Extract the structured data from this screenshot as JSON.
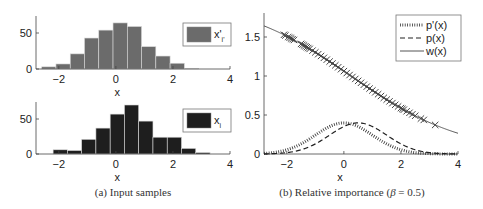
{
  "chart_data": [
    {
      "id": "hist-top",
      "type": "bar",
      "subtype": "histogram",
      "title": "",
      "xlabel": "x",
      "ylabel": "",
      "xlim": [
        -2.8,
        4
      ],
      "ylim": [
        0,
        68
      ],
      "xticks": [
        -2,
        0,
        2,
        4
      ],
      "yticks": [
        0,
        50
      ],
      "bin_width": 0.5,
      "bin_edges_start": -2.6,
      "values": [
        3,
        7,
        21,
        43,
        54,
        64,
        59,
        31,
        18,
        8,
        1
      ],
      "legend": {
        "label": "x'",
        "subscript": "i'",
        "placement": "top-right"
      },
      "color": "#6b6b6b"
    },
    {
      "id": "hist-bottom",
      "type": "bar",
      "subtype": "histogram",
      "title": "",
      "xlabel": "x",
      "ylabel": "",
      "xlim": [
        -2.8,
        4
      ],
      "ylim": [
        0,
        68
      ],
      "xticks": [
        -2,
        0,
        2,
        4
      ],
      "yticks": [
        0,
        50
      ],
      "bin_width": 0.5,
      "bin_edges_start": -2.2,
      "values": [
        6,
        5,
        21,
        37,
        57,
        70,
        47,
        24,
        24,
        8,
        2
      ],
      "legend": {
        "label": "x",
        "subscript": "i",
        "placement": "top-right"
      },
      "color": "#1e1e1e"
    },
    {
      "id": "relative-importance",
      "type": "line",
      "title": "",
      "xlabel": "x",
      "ylabel": "",
      "xlim": [
        -2.8,
        4
      ],
      "ylim": [
        0,
        1.8
      ],
      "xticks": [
        -2,
        0,
        2,
        4
      ],
      "yticks": [
        0,
        0.5,
        1,
        1.5
      ],
      "ytick_labels": [
        "0",
        "0.5",
        "1",
        "1.5"
      ],
      "beta": 0.5,
      "series": [
        {
          "name": "p'(x)",
          "style": "dotted",
          "distribution": "normal",
          "mean": 0,
          "std": 1
        },
        {
          "name": "p(x)",
          "style": "dashed",
          "distribution": "normal",
          "mean": 0.5,
          "std": 1
        },
        {
          "name": "w(x)",
          "style": "solid",
          "formula": "p'(x) / (beta*p'(x) + (1-beta)*p(x))"
        }
      ],
      "markers": {
        "name": "samples on w(x)",
        "symbol": "x",
        "x": [
          -2.1,
          -2.05,
          -1.95,
          -1.9,
          -1.85,
          -1.8,
          -1.75,
          -1.5,
          -1.45,
          -1.4,
          -1.35,
          -1.3,
          -1.25,
          -1.2,
          -1.1,
          -1.0,
          -0.9,
          -0.8,
          -0.7,
          -0.6,
          -0.5,
          -0.4,
          -0.3,
          -0.2,
          -0.1,
          0,
          0.1,
          0.2,
          0.3,
          0.4,
          0.5,
          0.6,
          0.7,
          0.8,
          0.9,
          1.0,
          1.1,
          1.2,
          1.3,
          1.4,
          1.5,
          1.6,
          1.7,
          1.8,
          1.9,
          2.0,
          2.05,
          2.1,
          2.2,
          2.3,
          2.4,
          2.5,
          2.7,
          2.8,
          3.2
        ]
      },
      "legend": {
        "labels": [
          "p'(x)",
          "p(x)",
          "w(x)"
        ],
        "placement": "top-right"
      }
    }
  ],
  "captions": {
    "left": "(a)  Input samples",
    "right_prefix": "(b)  Relative importance (",
    "right_beta": "β",
    "right_suffix": " = 0.5)"
  }
}
